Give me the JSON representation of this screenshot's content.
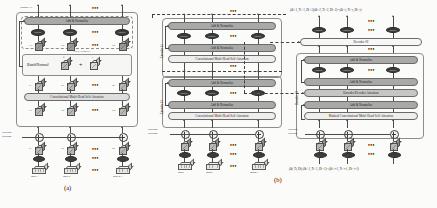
{
  "figure": {
    "captions": {
      "a": "(a)",
      "b": "(b)"
    }
  },
  "labels": {
    "add_norm": "Add & Normalize",
    "conv_mhsa": "Convolutional Multi-Head Self-Attention",
    "masked_conv_mhsa": "Masked Convolutional Multi-Head Self-Attention",
    "enc_dec_attn": "Encoder-Decoder Attention",
    "batchnorm": "BatchNormal",
    "plus_sign": "+",
    "encoder1": "Encoder #1",
    "encoder2": "Encoder #2",
    "decoder1": "Decoder #1",
    "decoder2": "Decoder #2",
    "positional_encoding_l1": "Positional",
    "positional_encoding_l2": "Encoding",
    "dots": "•••",
    "conv_token": "CONV",
    "selfattn_token": "Self-Attn",
    "embed_token": "Embed"
  },
  "panel_a": {
    "caption": "(a)",
    "group_label": "Encoder #1",
    "inner_add_norm": "Add & Normalize",
    "top_bar": "Add & Normalize",
    "batchnorm_label": "BatchNormal",
    "attention_bar": "Convolutional Multi-Head Self-Attention",
    "pos_enc": [
      "Positional",
      "Encoding"
    ],
    "cube_rows": {
      "row_z_top": [
        "Z'1",
        "Z'2",
        "Z'n"
      ],
      "row_z_mid": [
        "Z1",
        "Z2",
        "Zn"
      ],
      "row_x": [
        "X1",
        "X2",
        "Xn"
      ],
      "row_xl": [
        "X'1",
        "X'2",
        "X'n"
      ]
    },
    "batchnorm_terms": [
      "β",
      "γ"
    ],
    "inputs": [
      "Input 1",
      "Input 2",
      "Input n-1"
    ],
    "node_label": "CONV"
  },
  "panel_b": {
    "caption": "(b)",
    "encoder_stack": {
      "label_top": "Encoder #2",
      "label_bottom": "Encoder #1",
      "blocks_top": [
        "Add & Normalize",
        "Add & Normalize",
        "Convolutional Multi-Head Self-Attention"
      ],
      "blocks_bottom": [
        "Add & Normalize",
        "Add & Normalize",
        "Convolutional Multi-Head Self-Attention"
      ],
      "pos_enc": [
        "Positional",
        "Encoding"
      ],
      "inputs": [
        "Input1",
        "Input2",
        "Inputn-1"
      ],
      "node_label": "CONV"
    },
    "decoder_stack": {
      "label_decoder2": "Decoder #2",
      "label_decoder1": "Decoder #1",
      "blocks": [
        "Add & Normalize",
        "Add & Normalize",
        "Encoder-Decoder Attention",
        "Add & Normalize",
        "Masked Convolutional Multi-Head Self-Attention"
      ],
      "pos_enc": [
        "Positional",
        "Encoding"
      ],
      "node_label": "CONV",
      "top_formula": "(Δt+1, Tt+1, Dt+1)(Δt+2, Tt+2, Dt+2)···(Δt+r, Tt+r, Dt+r)",
      "bottom_formula": "(Δt, Tt, Dt) (Δt+1, Tt+1, Dt+1)···(Δt+r-1, Tt+r-1, Dt+r-1)"
    }
  }
}
